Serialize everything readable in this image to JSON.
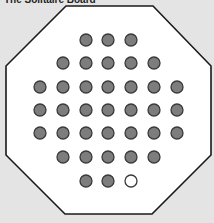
{
  "title": "The Solitaire Board",
  "board": {
    "shape": "octagon",
    "fill": "#ffffff",
    "stroke": "#1a1a1a",
    "background": "#e4e4e4",
    "octagon_points": [
      [
        66,
        6
      ],
      [
        153,
        6
      ],
      [
        211,
        66
      ],
      [
        211,
        155
      ],
      [
        152,
        214
      ],
      [
        65,
        214
      ],
      [
        6,
        155
      ],
      [
        6,
        66
      ]
    ],
    "columns_x": [
      40,
      63,
      86,
      108,
      131,
      154,
      177
    ],
    "rows_y": [
      40,
      63,
      87,
      110,
      133,
      157,
      181
    ],
    "peg_radius": 6,
    "peg_color": "#7d7d7d",
    "rows": [
      [
        null,
        null,
        "peg",
        "peg",
        "peg",
        null,
        null
      ],
      [
        null,
        "peg",
        "peg",
        "peg",
        "peg",
        "peg",
        null
      ],
      [
        "peg",
        "peg",
        "peg",
        "peg",
        "peg",
        "peg",
        "peg"
      ],
      [
        "peg",
        "peg",
        "peg",
        "peg",
        "peg",
        "peg",
        "peg"
      ],
      [
        "peg",
        "peg",
        "peg",
        "peg",
        "peg",
        "peg",
        "peg"
      ],
      [
        null,
        "peg",
        "peg",
        "peg",
        "peg",
        "peg",
        null
      ],
      [
        null,
        null,
        "peg",
        "peg",
        "hole",
        null,
        null
      ]
    ],
    "peg_count": 32,
    "empty_count": 1
  }
}
